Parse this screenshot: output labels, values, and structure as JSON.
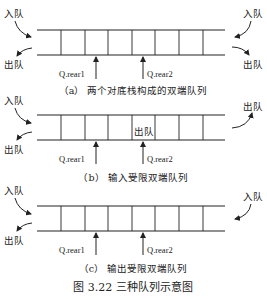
{
  "figure": {
    "title": "图 3.22    三种队列示意图",
    "cell_dividers_x": [
      61,
      85,
      108,
      132,
      155,
      179,
      203
    ],
    "panels": [
      {
        "id": "a",
        "caption": "（a）  两个对底栈构成的双端队列",
        "top_left_label": "入队",
        "bottom_left_label": "出队",
        "top_right_label": "入队",
        "bottom_right_label": "出队",
        "pointer1": "Q.rear1",
        "pointer2": "Q.rear2"
      },
      {
        "id": "b",
        "caption": "（b）  输入受限双端队列",
        "top_left_label": "入队",
        "bottom_left_label": "出队",
        "right_label": "出队",
        "inner_label": "出队",
        "pointer1": "Q.rear1",
        "pointer2": "Q.rear2"
      },
      {
        "id": "c",
        "caption": "（c）  输出受限双端队列",
        "top_left_label": "入队",
        "bottom_left_label": "出队",
        "top_right_label": "入队",
        "pointer1": "Q.rear1",
        "pointer2": "Q.rear2"
      }
    ]
  }
}
